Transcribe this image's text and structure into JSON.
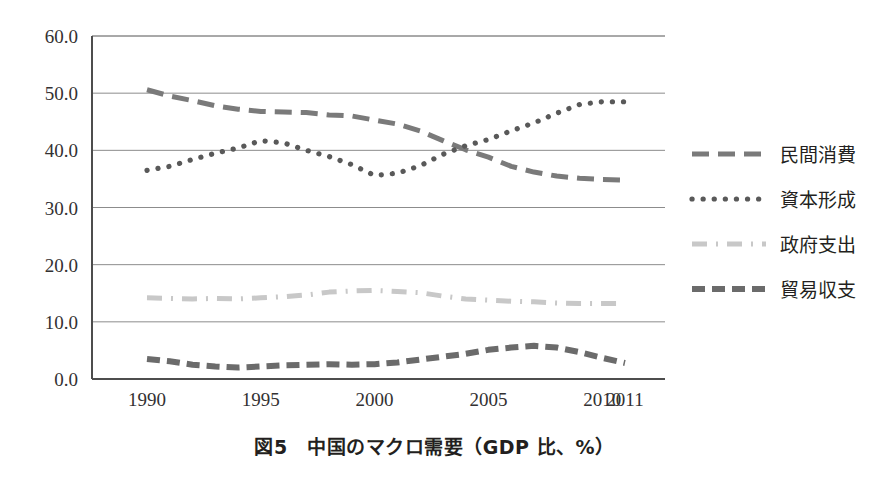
{
  "caption": "図5　中国のマクロ需要（GDP 比、%）",
  "chart_data": {
    "type": "line",
    "title": "図5　中国のマクロ需要（GDP 比、%）",
    "xlabel": "",
    "ylabel": "",
    "ylim": [
      0.0,
      60.0
    ],
    "yticks": [
      0.0,
      10.0,
      20.0,
      30.0,
      40.0,
      50.0,
      60.0
    ],
    "ytick_labels": [
      "0.0",
      "10.0",
      "20.0",
      "30.0",
      "40.0",
      "50.0",
      "60.0"
    ],
    "grid": true,
    "legend_position": "right",
    "x": [
      1990,
      1991,
      1992,
      1993,
      1994,
      1995,
      1996,
      1997,
      1998,
      1999,
      2000,
      2001,
      2002,
      2003,
      2004,
      2005,
      2006,
      2007,
      2008,
      2009,
      2010,
      2011
    ],
    "xtick_labels": [
      "1990",
      "1995",
      "2000",
      "2005",
      "2010",
      "2011"
    ],
    "xtick_values": [
      1990,
      1995,
      2000,
      2005,
      2010,
      2011
    ],
    "series": [
      {
        "name": "民間消費",
        "style": "dashed",
        "color": "#7a7a7a",
        "values": [
          50.6,
          49.5,
          48.7,
          47.8,
          47.2,
          46.8,
          46.7,
          46.6,
          46.2,
          46.0,
          45.3,
          44.6,
          43.4,
          41.7,
          40.1,
          38.8,
          37.2,
          36.2,
          35.5,
          35.1,
          34.9,
          34.8
        ]
      },
      {
        "name": "資本形成",
        "style": "dotted",
        "color": "#595959",
        "values": [
          36.5,
          37.2,
          38.4,
          39.5,
          40.4,
          41.7,
          41.3,
          40.0,
          38.9,
          37.5,
          35.6,
          36.0,
          37.3,
          39.3,
          40.8,
          41.9,
          43.4,
          44.8,
          46.5,
          48.0,
          48.5,
          48.5
        ]
      },
      {
        "name": "政府支出",
        "style": "dashdot",
        "color": "#c8c8c8",
        "values": [
          14.2,
          14.1,
          14.0,
          14.1,
          14.0,
          14.2,
          14.4,
          14.7,
          15.2,
          15.4,
          15.5,
          15.3,
          15.1,
          14.5,
          14.0,
          13.8,
          13.6,
          13.5,
          13.3,
          13.2,
          13.2,
          13.2
        ]
      },
      {
        "name": "貿易収支",
        "style": "dashed-thick",
        "color": "#6b6b6b",
        "values": [
          3.5,
          3.1,
          2.5,
          2.2,
          2.0,
          2.2,
          2.4,
          2.5,
          2.6,
          2.5,
          2.6,
          2.9,
          3.4,
          3.9,
          4.4,
          5.1,
          5.5,
          5.8,
          5.5,
          4.7,
          3.7,
          2.8
        ]
      }
    ]
  },
  "legend": {
    "items": [
      {
        "label": "民間消費",
        "style": "dashed",
        "color": "#7a7a7a"
      },
      {
        "label": "資本形成",
        "style": "dotted",
        "color": "#595959"
      },
      {
        "label": "政府支出",
        "style": "dashdot",
        "color": "#c8c8c8"
      },
      {
        "label": "貿易収支",
        "style": "dashed-thick",
        "color": "#6b6b6b"
      }
    ]
  },
  "axes": {
    "frame_color": "#4d4d4d",
    "grid_color": "#8c8c8c"
  }
}
